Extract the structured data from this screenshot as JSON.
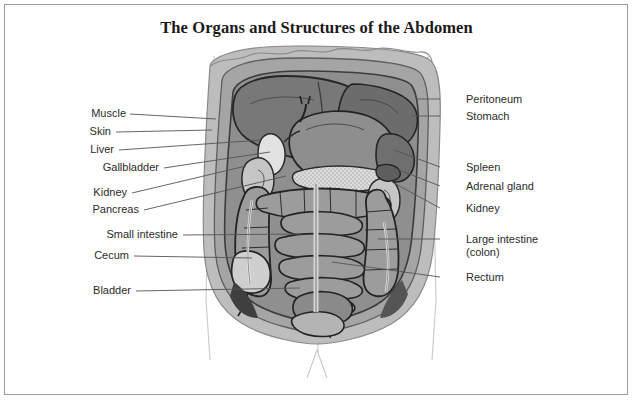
{
  "page": {
    "title": "The Organs and Structures of the Abdomen",
    "border_color": "#9a9a9a",
    "background": "#ffffff"
  },
  "palette": {
    "skin_outer": "#bdbdbd",
    "muscle_layer": "#a5a5a5",
    "peritoneum": "#8f8f8f",
    "liver": "#787878",
    "stomach": "#8e8e8e",
    "spleen": "#6f6f6f",
    "intestine_mid": "#9c9c9c",
    "intestine_light": "#cfcfcf",
    "pancreas": "#dcdcdc",
    "gallbladder": "#e2e2e2",
    "kidney": "#c6c6c6",
    "dark_shadow": "#4a4a4a",
    "outline": "#2e2e2e",
    "leader_line": "#555555",
    "body_silhouette": "#c8c8c8"
  },
  "labels_left": [
    {
      "id": "muscle",
      "text": "Muscle",
      "x": 78,
      "y": 113,
      "text_right": 126,
      "line_to_x": 215,
      "line_to_y": 118
    },
    {
      "id": "skin",
      "text": "Skin",
      "x": 78,
      "y": 131,
      "text_right": 111,
      "line_to_x": 211,
      "line_to_y": 129
    },
    {
      "id": "liver",
      "text": "Liver",
      "x": 78,
      "y": 149,
      "text_right": 114,
      "line_to_x": 262,
      "line_to_y": 140
    },
    {
      "id": "gallbladder",
      "text": "Gallbladder",
      "x": 84,
      "y": 167,
      "text_right": 159,
      "line_to_x": 270,
      "line_to_y": 152
    },
    {
      "id": "kidney-left",
      "text": "Kidney",
      "x": 78,
      "y": 192,
      "text_right": 127,
      "line_to_x": 245,
      "line_to_y": 165
    },
    {
      "id": "pancreas",
      "text": "Pancreas",
      "x": 78,
      "y": 209,
      "text_right": 139,
      "line_to_x": 285,
      "line_to_y": 175
    },
    {
      "id": "small-intestine",
      "text": "Small intestine",
      "x": 82,
      "y": 234,
      "text_right": 178,
      "line_to_x": 300,
      "line_to_y": 234
    },
    {
      "id": "cecum",
      "text": "Cecum",
      "x": 82,
      "y": 255,
      "text_right": 129,
      "line_to_x": 252,
      "line_to_y": 258
    },
    {
      "id": "bladder",
      "text": "Bladder",
      "x": 82,
      "y": 290,
      "text_right": 131,
      "line_to_x": 300,
      "line_to_y": 287
    }
  ],
  "labels_right": [
    {
      "id": "peritoneum",
      "text": "Peritoneum",
      "x": 466,
      "y": 94,
      "line_from_x": 440,
      "line_from_y": 99,
      "line_to_x": 416,
      "line_to_y": 99
    },
    {
      "id": "stomach",
      "text": "Stomach",
      "x": 466,
      "y": 111,
      "line_from_x": 440,
      "line_from_y": 116,
      "line_to_x": 413,
      "line_to_y": 116
    },
    {
      "id": "spleen",
      "text": "Spleen",
      "x": 466,
      "y": 162,
      "line_from_x": 440,
      "line_from_y": 167,
      "line_to_x": 392,
      "line_to_y": 150
    },
    {
      "id": "adrenal-gland",
      "text": "Adrenal gland",
      "x": 466,
      "y": 181,
      "line_from_x": 440,
      "line_from_y": 186,
      "line_to_x": 392,
      "line_to_y": 166
    },
    {
      "id": "kidney-right",
      "text": "Kidney",
      "x": 466,
      "y": 203,
      "line_from_x": 440,
      "line_from_y": 208,
      "line_to_x": 390,
      "line_to_y": 180
    },
    {
      "id": "large-intestine",
      "text": "Large intestine",
      "text_line2": "(colon)",
      "x": 466,
      "y": 234,
      "line_from_x": 440,
      "line_from_y": 239,
      "line_to_x": 378,
      "line_to_y": 239
    },
    {
      "id": "rectum",
      "text": "Rectum",
      "x": 466,
      "y": 272,
      "line_from_x": 440,
      "line_from_y": 277,
      "line_to_x": 330,
      "line_to_y": 262
    }
  ],
  "artwork": {
    "description": "Grayscale anatomical cutaway illustration of the human abdomen, anterior view, showing layered skin and muscle walls peeled back to reveal liver, stomach, spleen, kidneys, pancreas, small and large intestine, cecum, rectum and bladder."
  }
}
